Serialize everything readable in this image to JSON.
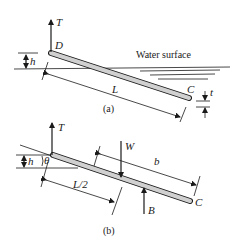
{
  "figure": {
    "part_a": {
      "caption": "(a)",
      "labels": {
        "tension": "T",
        "end_top": "D",
        "end_bottom": "C",
        "height": "h",
        "length": "L",
        "thickness": "t",
        "water": "Water surface"
      }
    },
    "part_b": {
      "caption": "(b)",
      "labels": {
        "tension": "T",
        "height": "h",
        "angle": "θ",
        "weight": "W",
        "buoyancy": "B",
        "half_length": "L/2",
        "distance_b": "b",
        "end_bottom": "C"
      }
    },
    "colors": {
      "ink": "#1a1a1a",
      "rod_fill": "#d0d0d0",
      "background": "#ffffff"
    }
  }
}
